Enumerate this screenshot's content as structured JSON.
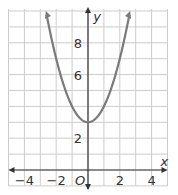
{
  "chart_data": {
    "type": "line",
    "title": "",
    "function": "y = x^2 + 3",
    "xlabel": "x",
    "ylabel": "y",
    "origin_label": "O",
    "xlim": [
      -5,
      5
    ],
    "ylim": [
      -1,
      10
    ],
    "grid": true,
    "x_ticks": [
      -4,
      -2,
      2,
      4
    ],
    "x_tick_labels": [
      "−4",
      "−2",
      "2",
      "4"
    ],
    "y_ticks": [
      2,
      6,
      8
    ],
    "y_tick_labels": [
      "2",
      "6",
      "8"
    ],
    "series": [
      {
        "name": "parabola",
        "x": [
          -2.65,
          -2,
          -1,
          0,
          1,
          2,
          2.65
        ],
        "y": [
          10,
          7,
          4,
          3,
          4,
          7,
          10
        ]
      }
    ],
    "colors": {
      "curve": "#7a7a7a",
      "grid": "#cccccc",
      "axis": "#333333"
    }
  }
}
